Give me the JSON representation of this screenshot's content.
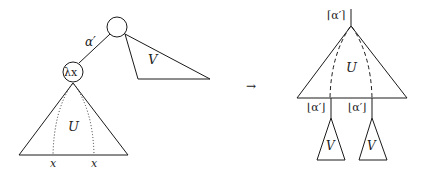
{
  "diagram": {
    "left": {
      "root_node_label": "",
      "edge_label": "α′",
      "lambda_node_label": "λx",
      "subtree_U_label": "U",
      "subtree_V_label": "V",
      "leaf_labels": [
        "x",
        "x"
      ]
    },
    "arrow": "→",
    "right": {
      "top_label": "⌈α′⌉",
      "subtree_U_label": "U",
      "branch_labels": [
        "⌊α′⌋",
        "⌊α′⌋"
      ],
      "copies_V_labels": [
        "V",
        "V"
      ]
    }
  }
}
